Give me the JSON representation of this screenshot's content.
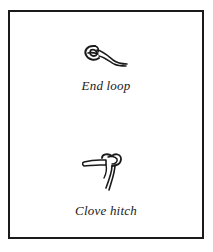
{
  "panel": {
    "items": [
      {
        "icon": "end-loop-knot-icon",
        "label": "End loop"
      },
      {
        "icon": "clove-hitch-knot-icon",
        "label": "Clove hitch"
      }
    ]
  },
  "colors": {
    "ink": "#1a1a1a",
    "background": "#ffffff"
  }
}
